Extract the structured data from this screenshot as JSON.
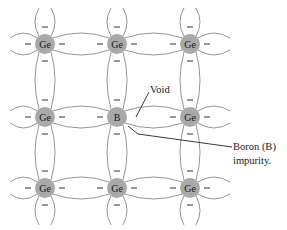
{
  "diagram": {
    "colors": {
      "atom_fill": "#a9a9a9",
      "bond_stroke": "#8a8a8a",
      "text": "#1a1a1a"
    },
    "atoms": [
      {
        "row": 0,
        "col": 0,
        "symbol": "Ge"
      },
      {
        "row": 0,
        "col": 1,
        "symbol": "Ge"
      },
      {
        "row": 0,
        "col": 2,
        "symbol": "Ge"
      },
      {
        "row": 1,
        "col": 0,
        "symbol": "Ge"
      },
      {
        "row": 1,
        "col": 1,
        "symbol": "B"
      },
      {
        "row": 1,
        "col": 2,
        "symbol": "Ge"
      },
      {
        "row": 2,
        "col": 0,
        "symbol": "Ge"
      },
      {
        "row": 2,
        "col": 1,
        "symbol": "Ge"
      },
      {
        "row": 2,
        "col": 2,
        "symbol": "Ge"
      }
    ],
    "electron_symbol": "−",
    "labels": {
      "void": "Void",
      "impurity_line1": "Boron (B)",
      "impurity_line2": "impurity."
    }
  }
}
